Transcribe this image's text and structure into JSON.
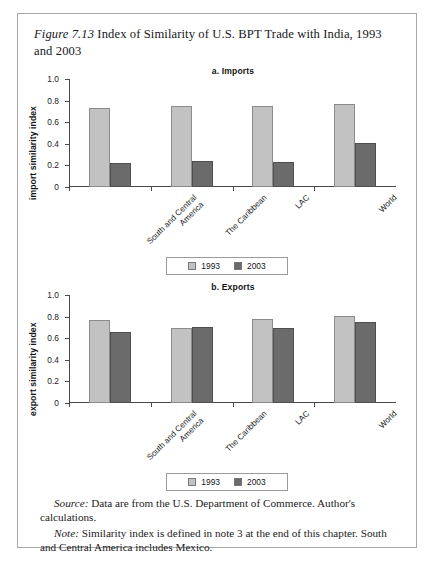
{
  "figure": {
    "label": "Figure 7.13",
    "title": " Index of Similarity of U.S. BPT Trade with India, 1993 and 2003"
  },
  "legend": {
    "series": [
      {
        "name": "1993",
        "color": "#c2c2c2"
      },
      {
        "name": "2003",
        "color": "#6b6b6b"
      }
    ]
  },
  "notes": {
    "source_lead": "Source:",
    "source_text": " Data are from the U.S. Department of Commerce. Author's calculations.",
    "note_lead": "Note:",
    "note_text": " Similarity index is defined in note 3 at the end of this chapter. South and Central America includes Mexico."
  },
  "chart_data": [
    {
      "type": "bar",
      "title": "a. Imports",
      "xlabel": "",
      "ylabel": "import similarity index",
      "ylim": [
        0,
        1.0
      ],
      "yticks": [
        "0",
        "0.2",
        "0.4",
        "0.6",
        "0.8",
        "1.0"
      ],
      "grid": false,
      "legend_position": "below",
      "categories": [
        "South and Central America",
        "The Caribbean",
        "LAC",
        "World"
      ],
      "series": [
        {
          "name": "1993",
          "color": "#c2c2c2",
          "values": [
            0.73,
            0.75,
            0.75,
            0.77
          ]
        },
        {
          "name": "2003",
          "color": "#6b6b6b",
          "values": [
            0.22,
            0.24,
            0.23,
            0.41
          ]
        }
      ]
    },
    {
      "type": "bar",
      "title": "b. Exports",
      "xlabel": "",
      "ylabel": "export similarity index",
      "ylim": [
        0,
        1.0
      ],
      "yticks": [
        "0",
        "0.2",
        "0.4",
        "0.6",
        "0.8",
        "1.0"
      ],
      "grid": false,
      "legend_position": "below",
      "categories": [
        "South and Central America",
        "The Caribbean",
        "LAC",
        "World"
      ],
      "series": [
        {
          "name": "1993",
          "color": "#c2c2c2",
          "values": [
            0.77,
            0.69,
            0.78,
            0.81
          ]
        },
        {
          "name": "2003",
          "color": "#6b6b6b",
          "values": [
            0.66,
            0.7,
            0.69,
            0.75
          ]
        }
      ]
    }
  ]
}
